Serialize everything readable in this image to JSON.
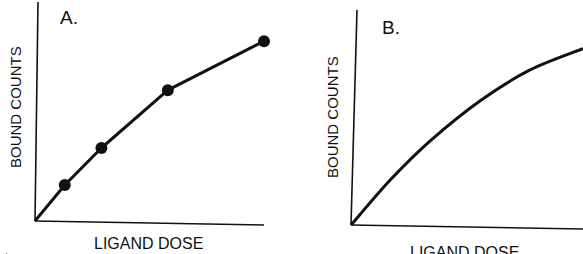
{
  "chart_data": [
    {
      "type": "line",
      "panel_label": "A.",
      "xlabel": "LIGAND DOSE",
      "ylabel": "BOUND COUNTS",
      "markers": true,
      "xlim": [
        0,
        100
      ],
      "ylim": [
        0,
        100
      ],
      "grid": false,
      "series": [
        {
          "name": "A",
          "x": [
            0,
            13,
            29,
            58,
            100
          ],
          "y": [
            0,
            16.5,
            33.5,
            60,
            82.5
          ],
          "marker_points": [
            1,
            2,
            3,
            4
          ]
        }
      ]
    },
    {
      "type": "line",
      "panel_label": "B.",
      "xlabel": "LIGAND DOSE",
      "ylabel": "BOUND COUNTS",
      "markers": false,
      "xlim": [
        0,
        100
      ],
      "ylim": [
        0,
        100
      ],
      "grid": false,
      "series": [
        {
          "name": "B",
          "x": [
            0,
            17,
            34,
            56,
            77,
            100
          ],
          "y": [
            0,
            21,
            39,
            58,
            72,
            82
          ]
        }
      ]
    }
  ],
  "caption_fragment": "Figure 1..."
}
